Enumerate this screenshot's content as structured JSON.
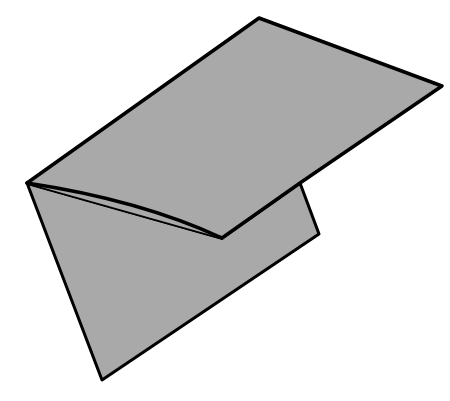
{
  "figure": {
    "colors": {
      "fill": "#a9a9a9",
      "stroke": "#000000",
      "background": "#ffffff"
    },
    "back_panel": {
      "points": "27,183 222,238 300,183 319,234 102,380"
    },
    "front_flap": {
      "points": "27,183 259,18 442,86 300,183 222,238"
    },
    "fold_crease": {
      "path": "M27,183 Q140,200 222,238"
    }
  }
}
